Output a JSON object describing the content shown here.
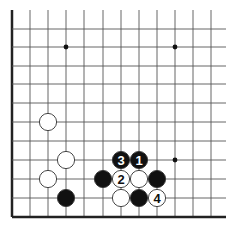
{
  "board": {
    "description": "Go board corner diagram (bottom-left corner)",
    "grid": {
      "columns_x": [
        12,
        30,
        48,
        66,
        84,
        103,
        121,
        139,
        157,
        175,
        193,
        211
      ],
      "rows_y": [
        29,
        47,
        66,
        84,
        103,
        122,
        141,
        160,
        179,
        198,
        217
      ],
      "top_y": 10,
      "right_x": 226,
      "edge_left_x": 12,
      "edge_bottom_y": 217
    },
    "colors": {
      "line": "#555555",
      "edge": "#222222",
      "black_stone": "#111111",
      "white_stone": "#ffffff",
      "stone_outline": "#333333"
    },
    "star_points": [
      {
        "x": 66,
        "y": 47
      },
      {
        "x": 175,
        "y": 47
      },
      {
        "x": 175,
        "y": 160
      }
    ],
    "stones": [
      {
        "color": "white",
        "x": 48,
        "y": 122,
        "label": ""
      },
      {
        "color": "white",
        "x": 66,
        "y": 160,
        "label": ""
      },
      {
        "color": "white",
        "x": 48,
        "y": 179,
        "label": ""
      },
      {
        "color": "black",
        "x": 66,
        "y": 198,
        "label": ""
      },
      {
        "color": "black",
        "x": 103,
        "y": 179,
        "label": ""
      },
      {
        "color": "black",
        "x": 121,
        "y": 160,
        "label": "3"
      },
      {
        "color": "black",
        "x": 139,
        "y": 160,
        "label": "1"
      },
      {
        "color": "white",
        "x": 121,
        "y": 179,
        "label": "2"
      },
      {
        "color": "white",
        "x": 139,
        "y": 179,
        "label": ""
      },
      {
        "color": "black",
        "x": 157,
        "y": 179,
        "label": ""
      },
      {
        "color": "white",
        "x": 121,
        "y": 198,
        "label": ""
      },
      {
        "color": "black",
        "x": 139,
        "y": 198,
        "label": ""
      },
      {
        "color": "white",
        "x": 157,
        "y": 198,
        "label": "4"
      }
    ]
  }
}
